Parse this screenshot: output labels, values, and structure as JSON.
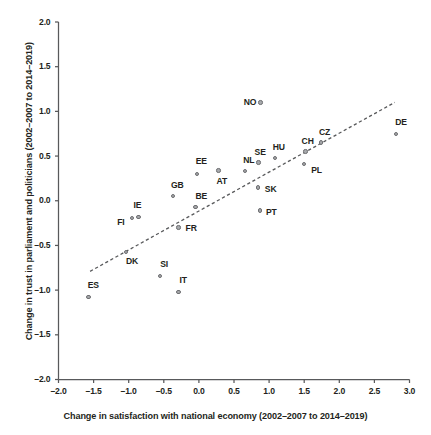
{
  "chart_data": {
    "type": "scatter",
    "title": "",
    "xlabel": "Change in satisfaction with national economy (2002–2007 to 2014–2019)",
    "ylabel": "Change in trust in parliament and politicians (2002–2007 to 2014–2019)",
    "xlim": [
      -2.0,
      3.0
    ],
    "ylim": [
      -2.0,
      2.0
    ],
    "xticks": [
      "–2.0",
      "–1.5",
      "–1.0",
      "–0.5",
      "0.0",
      "0.5",
      "1.0",
      "1.5",
      "2.0",
      "2.5",
      "3.0"
    ],
    "xtick_values": [
      -2.0,
      -1.5,
      -1.0,
      -0.5,
      0.0,
      0.5,
      1.0,
      1.5,
      2.0,
      2.5,
      3.0
    ],
    "yticks": [
      "2.0",
      "1.5",
      "1.0",
      "0.5",
      "0.0",
      "–0.5",
      "–1.0",
      "–1.5",
      "–2.0"
    ],
    "ytick_values": [
      2.0,
      1.5,
      1.0,
      0.5,
      0.0,
      -0.5,
      -1.0,
      -1.5,
      -2.0
    ],
    "grid": false,
    "legend": false,
    "marker_fill": "#a7a9ac",
    "marker_edge": "#6d6e71",
    "axis_color": "#58595b",
    "trendline": {
      "style": "dashed",
      "color": "#58595b",
      "x0": -1.55,
      "y0": -0.79,
      "x1": 2.79,
      "y1": 1.1
    },
    "points": [
      {
        "label": "ES",
        "x": -1.57,
        "y": -1.08,
        "label_dx": -1,
        "label_dy": -13
      },
      {
        "label": "FI",
        "x": -0.95,
        "y": -0.19,
        "label_dx": -15,
        "label_dy": 4
      },
      {
        "label": "IE",
        "x": -0.86,
        "y": -0.18,
        "label_dx": -5,
        "label_dy": -12
      },
      {
        "label": "DK",
        "x": -1.04,
        "y": -0.57,
        "label_dx": 0,
        "label_dy": 9
      },
      {
        "label": "SI",
        "x": -0.55,
        "y": -0.84,
        "label_dx": 0,
        "label_dy": -12
      },
      {
        "label": "IT",
        "x": -0.29,
        "y": -1.02,
        "label_dx": 1,
        "label_dy": -12
      },
      {
        "label": "FR",
        "x": -0.29,
        "y": -0.3,
        "label_dx": 7,
        "label_dy": 0
      },
      {
        "label": "GB",
        "x": -0.37,
        "y": 0.05,
        "label_dx": -2,
        "label_dy": -12
      },
      {
        "label": "BE",
        "x": -0.05,
        "y": -0.07,
        "label_dx": 0,
        "label_dy": -12
      },
      {
        "label": "EE",
        "x": -0.03,
        "y": 0.3,
        "label_dx": -1,
        "label_dy": -13
      },
      {
        "label": "AT",
        "x": 0.28,
        "y": 0.34,
        "label_dx": -2,
        "label_dy": 10
      },
      {
        "label": "NL",
        "x": 0.66,
        "y": 0.33,
        "label_dx": -2,
        "label_dy": -12
      },
      {
        "label": "SE",
        "x": 0.85,
        "y": 0.43,
        "label_dx": -4,
        "label_dy": -11
      },
      {
        "label": "HU",
        "x": 1.08,
        "y": 0.48,
        "label_dx": -2,
        "label_dy": -11
      },
      {
        "label": "SK",
        "x": 0.84,
        "y": 0.15,
        "label_dx": 7,
        "label_dy": 1
      },
      {
        "label": "PT",
        "x": 0.87,
        "y": -0.11,
        "label_dx": 6,
        "label_dy": 1
      },
      {
        "label": "NO",
        "x": 0.88,
        "y": 1.1,
        "label_dx": -17,
        "label_dy": -1
      },
      {
        "label": "CH",
        "x": 1.52,
        "y": 0.55,
        "label_dx": -4,
        "label_dy": -11
      },
      {
        "label": "CZ",
        "x": 1.74,
        "y": 0.65,
        "label_dx": -2,
        "label_dy": -11
      },
      {
        "label": "PL",
        "x": 1.5,
        "y": 0.41,
        "label_dx": 7,
        "label_dy": 5
      },
      {
        "label": "DE",
        "x": 2.81,
        "y": 0.75,
        "label_dx": -1,
        "label_dy": -12
      }
    ]
  }
}
